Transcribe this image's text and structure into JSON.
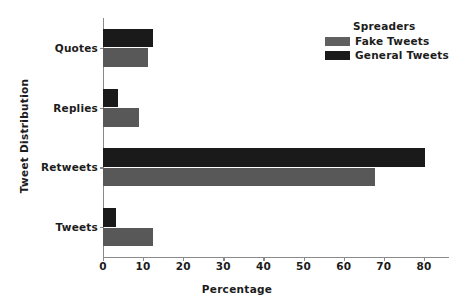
{
  "chart_data": {
    "type": "bar",
    "orientation": "horizontal",
    "title": "",
    "xlabel": "Percentage",
    "ylabel": "Tweet Distribution",
    "categories": [
      "Tweets",
      "Retweets",
      "Replies",
      "Quotes"
    ],
    "categories_top_to_bottom": [
      "Quotes",
      "Replies",
      "Retweets",
      "Tweets"
    ],
    "series": [
      {
        "name": "Fake Tweets",
        "color": "#585858",
        "values": [
          12.5,
          67.8,
          9.0,
          11.3
        ]
      },
      {
        "name": "General Tweets",
        "color": "#1a1a1a",
        "values": [
          3.2,
          80.2,
          3.7,
          12.4
        ]
      }
    ],
    "xlim": [
      0,
      86
    ],
    "xticks": [
      0,
      10,
      20,
      30,
      40,
      50,
      60,
      70,
      80
    ],
    "xtick_labels": [
      "0",
      "10",
      "20",
      "30",
      "40",
      "50",
      "60",
      "70",
      "80"
    ],
    "grid": false,
    "legend": {
      "title": "Spreaders",
      "position": "upper right",
      "entries": [
        {
          "label": "Fake Tweets",
          "color": "#585858"
        },
        {
          "label": "General Tweets",
          "color": "#1a1a1a"
        }
      ]
    }
  },
  "axis": {
    "xlabel": "Percentage",
    "ylabel": "Tweet Distribution"
  },
  "legend": {
    "title": "Spreaders",
    "fake_label": "Fake Tweets",
    "general_label": "General Tweets"
  },
  "colors": {
    "fake": "#585858",
    "general": "#1a1a1a",
    "axis": "#8a8a8a",
    "text": "#1c1c1c",
    "background": "#ffffff"
  }
}
